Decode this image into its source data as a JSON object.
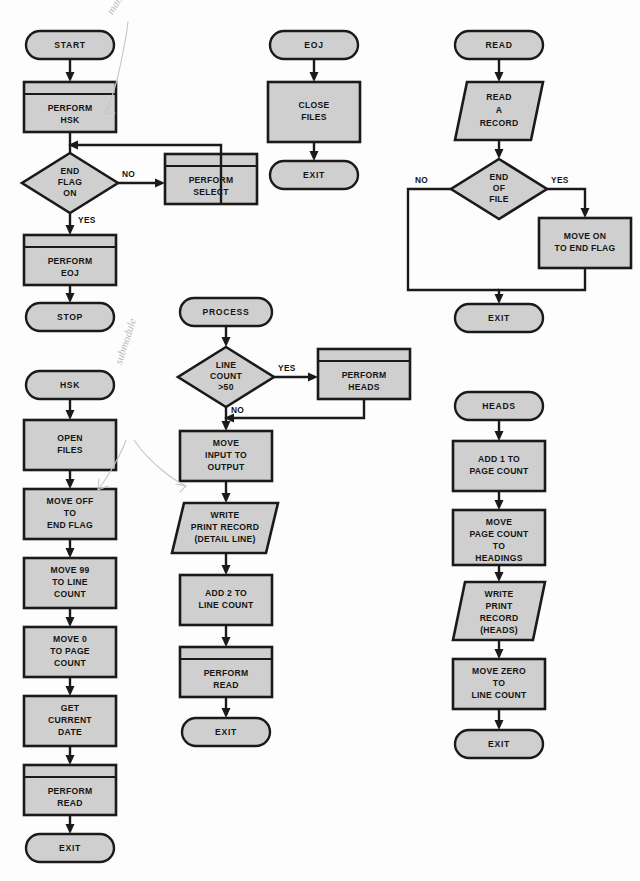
{
  "page": {
    "background_color": "#fdfdfd",
    "node_fill": "#cfcfcf",
    "node_stroke": "#1a1a1a"
  },
  "annotations": [
    {
      "id": "main-prog",
      "text": "main prog",
      "color": "#b9b9b9"
    },
    {
      "id": "submodule",
      "text": "submodule",
      "color": "#b9b9b9"
    }
  ],
  "modules": [
    {
      "id": "main",
      "name": "MAIN",
      "nodes": [
        {
          "id": "m1",
          "type": "terminal",
          "lines": [
            "START"
          ]
        },
        {
          "id": "m2",
          "type": "predefined",
          "lines": [
            "PERFORM",
            "HSK"
          ]
        },
        {
          "id": "m3",
          "type": "decision",
          "lines": [
            "END",
            "FLAG",
            "ON"
          ]
        },
        {
          "id": "m4",
          "type": "predefined",
          "lines": [
            "PERFORM",
            "SELECT"
          ]
        },
        {
          "id": "m5",
          "type": "predefined",
          "lines": [
            "PERFORM",
            "EOJ"
          ]
        },
        {
          "id": "m6",
          "type": "terminal",
          "lines": [
            "STOP"
          ]
        }
      ],
      "edge_labels": [
        {
          "id": "m-no",
          "text": "NO"
        },
        {
          "id": "m-yes",
          "text": "YES"
        }
      ]
    },
    {
      "id": "hsk",
      "name": "HSK",
      "nodes": [
        {
          "id": "h1",
          "type": "terminal",
          "lines": [
            "HSK"
          ]
        },
        {
          "id": "h2",
          "type": "process",
          "lines": [
            "OPEN",
            "FILES"
          ]
        },
        {
          "id": "h3",
          "type": "process",
          "lines": [
            "MOVE OFF",
            "TO",
            "END FLAG"
          ]
        },
        {
          "id": "h4",
          "type": "process",
          "lines": [
            "MOVE 99",
            "TO LINE",
            "COUNT"
          ]
        },
        {
          "id": "h5",
          "type": "process",
          "lines": [
            "MOVE 0",
            "TO PAGE",
            "COUNT"
          ]
        },
        {
          "id": "h6",
          "type": "process",
          "lines": [
            "GET",
            "CURRENT",
            "DATE"
          ]
        },
        {
          "id": "h7",
          "type": "predefined",
          "lines": [
            "PERFORM",
            "READ"
          ]
        },
        {
          "id": "h8",
          "type": "terminal",
          "lines": [
            "EXIT"
          ]
        }
      ]
    },
    {
      "id": "eoj",
      "name": "EOJ",
      "nodes": [
        {
          "id": "e1",
          "type": "terminal",
          "lines": [
            "EOJ"
          ]
        },
        {
          "id": "e2",
          "type": "process",
          "lines": [
            "CLOSE",
            "FILES"
          ]
        },
        {
          "id": "e3",
          "type": "terminal",
          "lines": [
            "EXIT"
          ]
        }
      ]
    },
    {
      "id": "process",
      "name": "PROCESS",
      "nodes": [
        {
          "id": "p1",
          "type": "terminal",
          "lines": [
            "PROCESS"
          ]
        },
        {
          "id": "p2",
          "type": "decision",
          "lines": [
            "LINE",
            "COUNT",
            ">50"
          ]
        },
        {
          "id": "p3",
          "type": "predefined",
          "lines": [
            "PERFORM",
            "HEADS"
          ]
        },
        {
          "id": "p4",
          "type": "process",
          "lines": [
            "MOVE",
            "INPUT TO",
            "OUTPUT"
          ]
        },
        {
          "id": "p5",
          "type": "io",
          "lines": [
            "WRITE",
            "PRINT RECORD",
            "(DETAIL LINE)"
          ]
        },
        {
          "id": "p6",
          "type": "process",
          "lines": [
            "ADD 2 TO",
            "LINE COUNT"
          ]
        },
        {
          "id": "p7",
          "type": "predefined",
          "lines": [
            "PERFORM",
            "READ"
          ]
        },
        {
          "id": "p8",
          "type": "terminal",
          "lines": [
            "EXIT"
          ]
        }
      ],
      "edge_labels": [
        {
          "id": "p-yes",
          "text": "YES"
        },
        {
          "id": "p-no",
          "text": "NO"
        }
      ]
    },
    {
      "id": "read",
      "name": "READ",
      "nodes": [
        {
          "id": "r1",
          "type": "terminal",
          "lines": [
            "READ"
          ]
        },
        {
          "id": "r2",
          "type": "io",
          "lines": [
            "READ",
            "A",
            "RECORD"
          ]
        },
        {
          "id": "r3",
          "type": "decision",
          "lines": [
            "END",
            "OF",
            "FILE"
          ]
        },
        {
          "id": "r4",
          "type": "process",
          "lines": [
            "MOVE ON",
            "TO END FLAG"
          ]
        },
        {
          "id": "r5",
          "type": "terminal",
          "lines": [
            "EXIT"
          ]
        }
      ],
      "edge_labels": [
        {
          "id": "r-no",
          "text": "NO"
        },
        {
          "id": "r-yes",
          "text": "YES"
        }
      ]
    },
    {
      "id": "heads",
      "name": "HEADS",
      "nodes": [
        {
          "id": "d1",
          "type": "terminal",
          "lines": [
            "HEADS"
          ]
        },
        {
          "id": "d2",
          "type": "process",
          "lines": [
            "ADD 1 TO",
            "PAGE COUNT"
          ]
        },
        {
          "id": "d3",
          "type": "process",
          "lines": [
            "MOVE",
            "PAGE COUNT",
            "TO",
            "HEADINGS"
          ]
        },
        {
          "id": "d4",
          "type": "io",
          "lines": [
            "WRITE",
            "PRINT",
            "RECORD",
            "(HEADS)"
          ]
        },
        {
          "id": "d5",
          "type": "process",
          "lines": [
            "MOVE ZERO",
            "TO",
            "LINE COUNT"
          ]
        },
        {
          "id": "d6",
          "type": "terminal",
          "lines": [
            "EXIT"
          ]
        }
      ]
    }
  ]
}
